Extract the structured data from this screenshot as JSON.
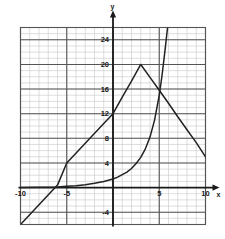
{
  "chart_data": {
    "type": "line",
    "title": "",
    "xlabel": "x",
    "ylabel": "y",
    "xlim": [
      -10,
      10
    ],
    "ylim": [
      -6,
      26
    ],
    "grid": true,
    "minor_grid_step": 1,
    "x_major_step": 5,
    "y_major_step": 4,
    "legend": "none",
    "x_ticks": [
      -10,
      -5,
      5,
      10
    ],
    "x_tick_labels": [
      "-10",
      "-5",
      "5",
      "10"
    ],
    "y_ticks": [
      24,
      20,
      16,
      12,
      8,
      4,
      -4
    ],
    "y_tick_labels": [
      "24",
      "20",
      "16",
      "12",
      "8",
      "4",
      "-4"
    ],
    "series": [
      {
        "name": "piecewise-linear",
        "type": "line",
        "color": "#222222",
        "points": [
          [
            -10.0,
            -6.0
          ],
          [
            -8.0,
            -2.8
          ],
          [
            -6.0,
            0.4
          ],
          [
            -5.0,
            4.0
          ],
          [
            -3.0,
            7.2
          ],
          [
            -1.0,
            10.4
          ],
          [
            0.0,
            12.0
          ],
          [
            1.0,
            14.7
          ],
          [
            2.0,
            17.3
          ],
          [
            3.0,
            20.0
          ],
          [
            4.0,
            17.9
          ],
          [
            5.0,
            15.8
          ],
          [
            6.0,
            13.7
          ],
          [
            7.0,
            11.5
          ],
          [
            8.0,
            9.4
          ],
          [
            9.0,
            7.3
          ],
          [
            10.0,
            5.0
          ]
        ],
        "peak": [
          3.0,
          20.0
        ]
      },
      {
        "name": "exponential",
        "type": "line",
        "color": "#222222",
        "points": [
          [
            -10.0,
            0.02
          ],
          [
            -8.0,
            0.05
          ],
          [
            -6.0,
            0.1
          ],
          [
            -5.0,
            0.2
          ],
          [
            -4.0,
            0.3
          ],
          [
            -3.0,
            0.45
          ],
          [
            -2.0,
            0.7
          ],
          [
            -1.0,
            1.0
          ],
          [
            0.0,
            1.4
          ],
          [
            0.5,
            1.7
          ],
          [
            1.0,
            2.1
          ],
          [
            1.5,
            2.5
          ],
          [
            2.0,
            3.1
          ],
          [
            2.5,
            3.9
          ],
          [
            3.0,
            4.9
          ],
          [
            3.5,
            6.3
          ],
          [
            4.0,
            8.2
          ],
          [
            4.5,
            11.0
          ],
          [
            5.0,
            15.0
          ],
          [
            5.3,
            18.2
          ],
          [
            5.6,
            22.0
          ],
          [
            5.9,
            26.0
          ]
        ]
      }
    ],
    "annotations": [
      {
        "name": "intersection",
        "x": 5.0,
        "y": 15.8
      }
    ]
  },
  "axis": {
    "x_axis_label": "x",
    "y_axis_label": "y"
  },
  "colors": {
    "curve": "#222222",
    "axis": "#1a1a1a",
    "major_grid": "#555555",
    "minor_grid": "#c8c8c8",
    "background": "#ffffff"
  }
}
